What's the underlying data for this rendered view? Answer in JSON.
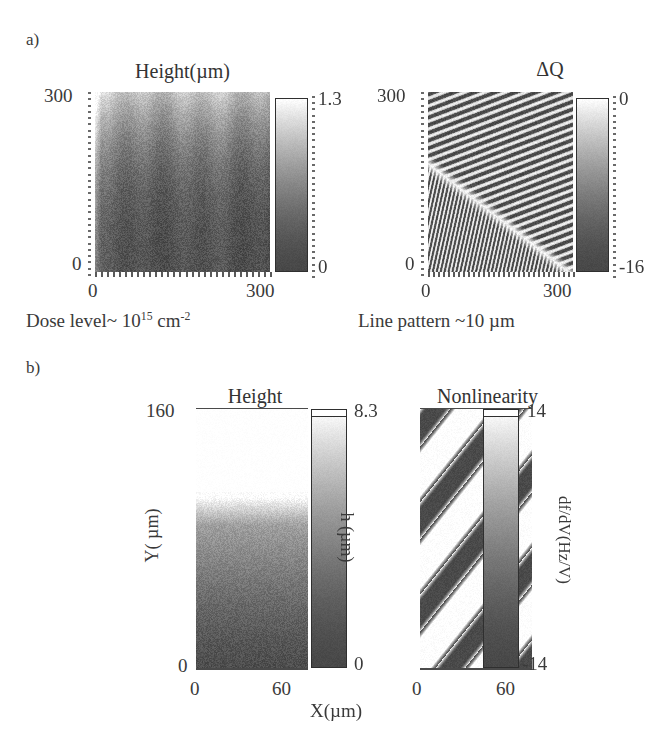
{
  "figure": {
    "panels": [
      {
        "letter": "a)",
        "plots": [
          {
            "title": "Height(µm)",
            "y_max": "300",
            "y_min": "0",
            "x_min": "0",
            "x_max": "300",
            "cbar_max": "1.3",
            "cbar_min": "0",
            "cbar_title": "",
            "caption_prefix": "Dose level~ 10",
            "caption_exp": "15",
            "caption_unit": " cm",
            "caption_unit_exp": "-2"
          },
          {
            "title": "",
            "cbar_title": "ΔQ",
            "y_max": "300",
            "y_min": "0",
            "x_min": "0",
            "x_max": "300",
            "cbar_max": "0",
            "cbar_min": "-16",
            "caption": "Line pattern ~10 µm"
          }
        ]
      },
      {
        "letter": "b)",
        "plots": [
          {
            "title": "Height",
            "y_max": "160",
            "y_min": "0",
            "x_min": "0",
            "x_max": "60",
            "cbar_max": "8.3",
            "cbar_min": "0",
            "cbar_axis_label": "h (µm)",
            "y_axis_label": "Y( µm)",
            "x_axis_label": "X(µm)"
          },
          {
            "title": "Nonlinearity",
            "x_min": "0",
            "x_max": "60",
            "cbar_max": "14",
            "cbar_min": "-14",
            "cbar_axis_label": "df/dV(Hz/V)"
          }
        ]
      }
    ]
  },
  "chart_data": [
    {
      "type": "heatmap",
      "id": "a-left-height",
      "title": "Height(µm)",
      "xlabel": "Dose level~ 10^15 cm^-2",
      "ylabel": "",
      "xlim": [
        0,
        300
      ],
      "ylim": [
        0,
        300
      ],
      "xticklabels": [
        "0",
        "300"
      ],
      "yticklabels": [
        "0",
        "300"
      ],
      "colorbar": {
        "label": "Height (µm)",
        "vmin": 0,
        "vmax": 1.3,
        "ticklabels": [
          "0",
          "1.3"
        ],
        "colormap": "grayscale-dark-to-white"
      },
      "description": "Noisy AFM height map; brighter (higher) band along the top edge, darkening progressively toward the bottom; faint vertical striping from discrete dose columns.",
      "grid": false
    },
    {
      "type": "heatmap",
      "id": "a-right-deltaQ",
      "title": "ΔQ",
      "xlabel": "Line pattern ~10 µm",
      "ylabel": "",
      "xlim": [
        0,
        300
      ],
      "ylim": [
        0,
        300
      ],
      "xticklabels": [
        "0",
        "300"
      ],
      "yticklabels": [
        "0",
        "300"
      ],
      "colorbar": {
        "label": "ΔQ",
        "vmin": -16,
        "vmax": 0,
        "ticklabels": [
          "-16",
          "0"
        ],
        "colormap": "grayscale-dark-to-white"
      },
      "description": "Charge-difference map showing two interleaved diagonal line-grating domains of ~10 µm pitch; shallow-angle stripes fill the upper region and steeper, denser stripes fill the lower-left region, separated by a bright diagonal boundary.",
      "grid": false
    },
    {
      "type": "heatmap",
      "id": "b-left-height",
      "title": "Height",
      "xlabel": "X(µm)",
      "ylabel": "Y( µm)",
      "xlim": [
        0,
        60
      ],
      "ylim": [
        0,
        160
      ],
      "xticklabels": [
        "0",
        "60"
      ],
      "yticklabels": [
        "0",
        "160"
      ],
      "colorbar": {
        "label": "h (µm)",
        "vmin": 0,
        "vmax": 8.3,
        "ticklabels": [
          "0",
          "8.3"
        ],
        "colormap": "grayscale-dark-to-white"
      },
      "description": "Vertically graded height map: saturated white above Y ≈ 105 µm, a rapid transition band near Y ≈ 95-105 µm, then uniformly grey darkening toward Y = 0.",
      "grid": false
    },
    {
      "type": "heatmap",
      "id": "b-right-nonlinearity",
      "title": "Nonlinearity",
      "xlabel": "X(µm)",
      "ylabel": "",
      "xlim": [
        0,
        60
      ],
      "ylim": [
        0,
        160
      ],
      "xticklabels": [
        "0",
        "60"
      ],
      "yticklabels": [
        "",
        ""
      ],
      "colorbar": {
        "label": "df/dV(Hz/V)",
        "vmin": -14,
        "vmax": 14,
        "ticklabels": [
          "-14",
          "14"
        ],
        "colormap": "grayscale-dark-to-white"
      },
      "description": "Frequency-shift nonlinearity map with four broad dark diagonal bands running from upper-left to lower-right on a white background.",
      "grid": false
    }
  ]
}
